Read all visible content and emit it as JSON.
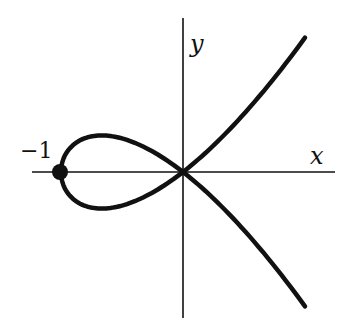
{
  "chart_data": {
    "type": "line",
    "title": "",
    "equation": "y^2 = x^2(x+1)",
    "xlabel": "x",
    "ylabel": "y",
    "annotations": [
      {
        "text": "-1",
        "x": -1,
        "y": 0,
        "marker": "filled-dot"
      }
    ],
    "xlim": [
      -1.0,
      1.0
    ],
    "grid": false,
    "series": [
      {
        "name": "upper branch",
        "x": [
          -1,
          -0.9,
          -0.667,
          -0.5,
          -0.25,
          0,
          0.25,
          0.5,
          0.75,
          1.0
        ],
        "y": [
          0,
          0.285,
          0.385,
          0.354,
          0.217,
          0,
          -0.28,
          -0.612,
          -0.992,
          -1.414
        ]
      },
      {
        "name": "lower branch",
        "x": [
          -1,
          -0.9,
          -0.667,
          -0.5,
          -0.25,
          0,
          0.25,
          0.5,
          0.75,
          1.0
        ],
        "y": [
          0,
          -0.285,
          -0.385,
          -0.354,
          -0.217,
          0,
          0.28,
          0.612,
          0.992,
          1.414
        ]
      }
    ]
  },
  "labels": {
    "x": "x",
    "y": "y",
    "minus_one": "−1"
  },
  "colors": {
    "curve": "#111111",
    "axis": "#111111"
  }
}
